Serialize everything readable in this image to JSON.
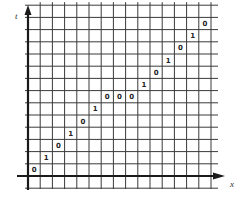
{
  "diagram": {
    "type": "spacetime-grid",
    "axes": {
      "vertical_label": "t",
      "horizontal_label": "x"
    },
    "colors": {
      "grid": "#3a3a3a",
      "axis": "#1a1a1a",
      "text": "#222222",
      "background": "#ffffff"
    },
    "grid": {
      "columns": 15,
      "rows": 14
    },
    "cells": [
      {
        "col": 0,
        "row": 0,
        "value": "0"
      },
      {
        "col": 1,
        "row": 1,
        "value": "1"
      },
      {
        "col": 2,
        "row": 2,
        "value": "0"
      },
      {
        "col": 3,
        "row": 3,
        "value": "1"
      },
      {
        "col": 4,
        "row": 4,
        "value": "0"
      },
      {
        "col": 5,
        "row": 5,
        "value": "1"
      },
      {
        "col": 6,
        "row": 6,
        "value": "0"
      },
      {
        "col": 7,
        "row": 6,
        "value": "0"
      },
      {
        "col": 8,
        "row": 6,
        "value": "0"
      },
      {
        "col": 9,
        "row": 7,
        "value": "1"
      },
      {
        "col": 10,
        "row": 8,
        "value": "0"
      },
      {
        "col": 11,
        "row": 9,
        "value": "1"
      },
      {
        "col": 12,
        "row": 10,
        "value": "0"
      },
      {
        "col": 13,
        "row": 11,
        "value": "1"
      },
      {
        "col": 14,
        "row": 12,
        "value": "0"
      }
    ]
  }
}
